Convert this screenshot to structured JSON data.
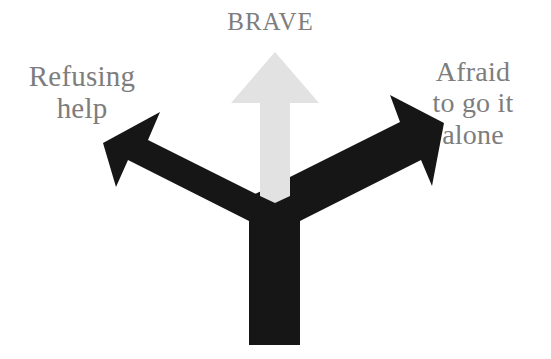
{
  "figure": {
    "title": "BRAVE",
    "background_color": "#ffffff",
    "labels": {
      "top": "BRAVE",
      "left": "Refusing\nhelp",
      "right": "Afraid\nto go it\nalone"
    },
    "text_color": "#7d7d7d",
    "arrows": {
      "black": {
        "color": "#161616",
        "name": "forked-two-headed-arrow",
        "directions": [
          "upper-left",
          "upper-right"
        ],
        "stem": "vertical-bottom"
      },
      "grey": {
        "color": "#e2e2e2",
        "name": "up-arrow",
        "directions": [
          "up"
        ]
      }
    }
  }
}
